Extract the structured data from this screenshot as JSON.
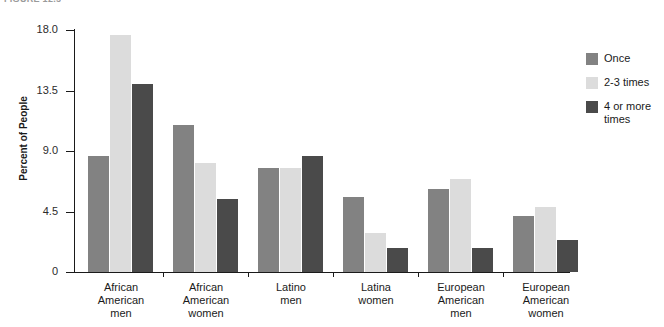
{
  "figure": {
    "caption_partial": "FIGURE 12.5"
  },
  "chart_data": {
    "type": "bar",
    "title": "",
    "xlabel": "",
    "ylabel": "Percent of People",
    "ylim": [
      0,
      18.0
    ],
    "yticks": [
      "0",
      "4.5",
      "9.0",
      "13.5",
      "18.0"
    ],
    "ytick_values": [
      0,
      4.5,
      9.0,
      13.5,
      18.0
    ],
    "grid": false,
    "legend_position": "right",
    "categories": [
      "African American men",
      "African American women",
      "Latino men",
      "Latina women",
      "European American men",
      "European American women"
    ],
    "category_lines": [
      [
        "African",
        "American",
        "men"
      ],
      [
        "African",
        "American",
        "women"
      ],
      [
        "Latino",
        "men"
      ],
      [
        "Latina",
        "women"
      ],
      [
        "European",
        "American",
        "men"
      ],
      [
        "European",
        "American",
        "women"
      ]
    ],
    "series": [
      {
        "name": "Once",
        "color": "#828282",
        "values": [
          8.6,
          10.9,
          7.7,
          5.6,
          6.2,
          4.2
        ]
      },
      {
        "name": "2-3 times",
        "color": "#dcdcdc",
        "values": [
          17.6,
          8.1,
          7.7,
          2.9,
          6.9,
          4.8
        ]
      },
      {
        "name": "4 or more times",
        "color": "#4a4a4a",
        "values": [
          14.0,
          5.4,
          8.6,
          1.8,
          1.8,
          2.4
        ]
      }
    ]
  },
  "legend": {
    "items": [
      {
        "label": "Once",
        "color": "#828282"
      },
      {
        "label": "2-3 times",
        "color": "#dcdcdc"
      },
      {
        "label": "4 or more times",
        "color": "#4a4a4a"
      }
    ]
  }
}
